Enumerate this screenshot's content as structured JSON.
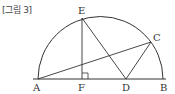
{
  "caption": "[그림 3]",
  "diagram": {
    "type": "geometry",
    "stroke_color": "#333333",
    "background": "#ffffff",
    "points": {
      "A": {
        "label": "A",
        "x": 38,
        "y": 79
      },
      "B": {
        "label": "B",
        "x": 163,
        "y": 79
      },
      "C": {
        "label": "C",
        "x": 151,
        "y": 42
      },
      "D": {
        "label": "D",
        "x": 126,
        "y": 79
      },
      "E": {
        "label": "E",
        "x": 82,
        "y": 18
      },
      "F": {
        "label": "F",
        "x": 82,
        "y": 79
      }
    },
    "segments": [
      "AB",
      "AC",
      "EF",
      "ED",
      "DC"
    ],
    "arc": {
      "from": "A",
      "to": "B",
      "center_x": 100.5,
      "center_y": 79,
      "radius": 62.5
    },
    "right_angle_at": "F"
  }
}
